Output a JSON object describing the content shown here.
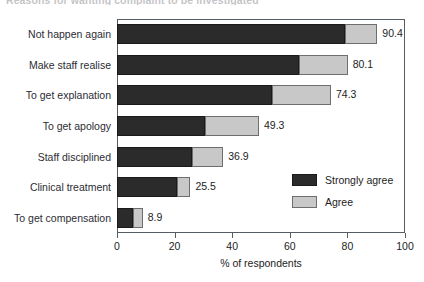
{
  "chart_data": {
    "type": "bar",
    "orientation": "horizontal",
    "stacked": true,
    "title": "Reasons for wanting complaint to be investigated",
    "xlabel": "% of respondents",
    "ylabel": "",
    "xlim": [
      0,
      100
    ],
    "xticks": [
      "0",
      "20",
      "40",
      "60",
      "80",
      "100"
    ],
    "grid": false,
    "legend_position": "center-right-inside",
    "categories": [
      "Not happen again",
      "Make staff realise",
      "To get explanation",
      "To get apology",
      "Staff disciplined",
      "Clinical treatment",
      "To get compensation"
    ],
    "series": [
      {
        "name": "Strongly agree",
        "color": "#2b2b2b",
        "values": [
          79.2,
          63.2,
          53.8,
          30.6,
          26.0,
          20.8,
          5.6
        ]
      },
      {
        "name": "Agree",
        "color": "#c8c8c8",
        "values": [
          11.2,
          16.9,
          20.5,
          18.7,
          10.9,
          4.7,
          3.3
        ]
      }
    ],
    "totals": [
      90.4,
      80.1,
      74.3,
      49.3,
      36.9,
      25.5,
      8.9
    ],
    "total_labels": [
      "90.4",
      "80.1",
      "74.3",
      "49.3",
      "36.9",
      "25.5",
      "8.9"
    ]
  },
  "legend": {
    "items": [
      {
        "label": "Strongly agree",
        "swatch": "strong"
      },
      {
        "label": "Agree",
        "swatch": "agree"
      }
    ]
  },
  "colors": {
    "strongly_agree": "#2b2b2b",
    "agree": "#c8c8c8",
    "axis": "#555c63",
    "text": "#1d1d1d",
    "background": "#ffffff"
  }
}
